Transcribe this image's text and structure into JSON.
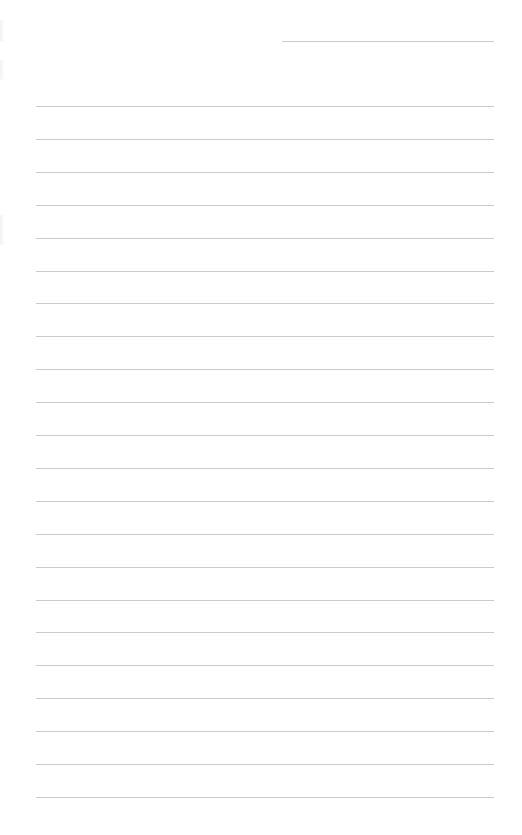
{
  "page": {
    "type": "lined-paper",
    "background_color": "#ffffff",
    "line_color": "#cbcbcb"
  },
  "header_line": {
    "x_start": 282,
    "x_end": 494,
    "y": 41
  },
  "ruled_lines": {
    "count": 22,
    "x_start": 36,
    "x_end": 494,
    "first_y": 106,
    "spacing": 32.9
  },
  "binding_marks": [
    {
      "y": 20,
      "height": 22
    },
    {
      "y": 60,
      "height": 20
    },
    {
      "y": 215,
      "height": 30
    }
  ]
}
